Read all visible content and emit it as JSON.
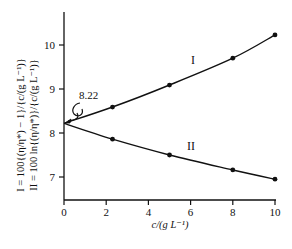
{
  "chart_data": {
    "type": "line",
    "title": "",
    "xlabel": "c/(g L⁻¹)",
    "ylabel_lines": [
      "I = 100{(η/η*) − 1}/{c/(g L⁻¹)}",
      "II = 100 ln{(η/η*)}/{c/(g L⁻¹)}"
    ],
    "xlim": [
      0,
      10
    ],
    "ylim": [
      6.5,
      10.75
    ],
    "x_ticks": [
      "0",
      "2",
      "4",
      "6",
      "8",
      "10"
    ],
    "y_ticks": [
      "7",
      "8",
      "9",
      "10"
    ],
    "grid": false,
    "legend": "none (inline curve labels)",
    "series": [
      {
        "name": "I",
        "x": [
          0,
          2.3,
          5.0,
          8.0,
          10.0
        ],
        "values": [
          8.22,
          8.59,
          9.09,
          9.7,
          10.23
        ],
        "markers_at": [
          2.3,
          5.0,
          8.0,
          10.0
        ]
      },
      {
        "name": "II",
        "x": [
          0,
          2.3,
          5.0,
          8.0,
          10.0
        ],
        "values": [
          8.22,
          7.86,
          7.5,
          7.16,
          6.95
        ],
        "markers_at": [
          2.3,
          5.0,
          8.0,
          10.0
        ]
      }
    ],
    "annotations": [
      {
        "text": "8.22",
        "points_to": {
          "x": 0,
          "y": 8.22
        },
        "style": "squiggle arrow"
      }
    ]
  }
}
